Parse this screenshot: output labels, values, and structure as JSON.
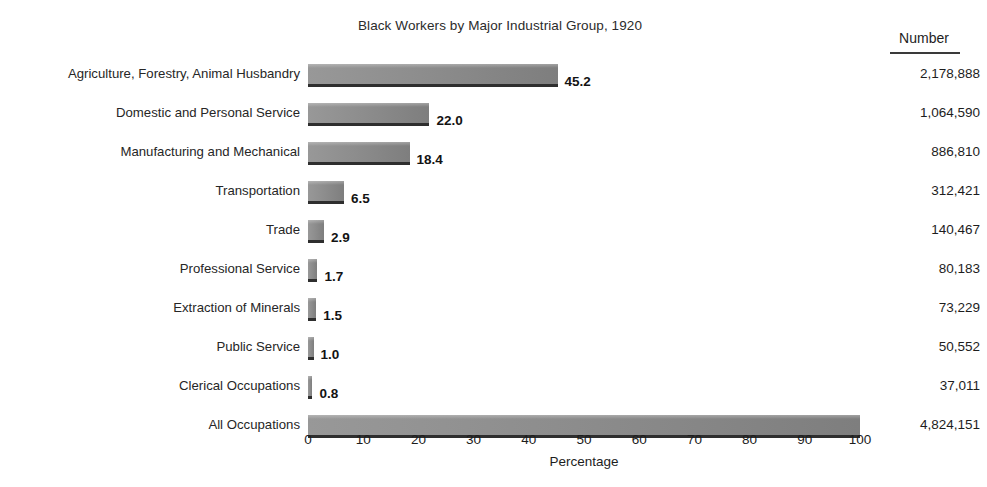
{
  "chart_data": {
    "type": "bar",
    "title": "Black Workers by Major Industrial Group, 1920",
    "orientation": "horizontal",
    "xlabel": "Percentage",
    "ylabel": "",
    "xlim": [
      0,
      100
    ],
    "xticks": [
      0,
      10,
      20,
      30,
      40,
      50,
      60,
      70,
      80,
      90,
      100
    ],
    "grid": false,
    "legend": null,
    "value_column_header": "Number",
    "categories": [
      "Agriculture, Forestry, Animal Husbandry",
      "Domestic and Personal Service",
      "Manufacturing and Mechanical",
      "Transportation",
      "Trade",
      "Professional Service",
      "Extraction of Minerals",
      "Public Service",
      "Clerical Occupations",
      "All Occupations"
    ],
    "values": [
      45.2,
      22.0,
      18.4,
      6.5,
      2.9,
      1.7,
      1.5,
      1.0,
      0.8,
      100.0
    ],
    "value_labels": [
      "45.2",
      "22.0",
      "18.4",
      "6.5",
      "2.9",
      "1.7",
      "1.5",
      "1.0",
      "0.8",
      ""
    ],
    "counts": [
      2178888,
      1064590,
      886810,
      312421,
      140467,
      80183,
      73229,
      50552,
      37011,
      4824151
    ],
    "count_labels": [
      "2,178,888",
      "1,064,590",
      "886,810",
      "312,421",
      "140,467",
      "80,183",
      "73,229",
      "50,552",
      "37,011",
      "4,824,151"
    ],
    "bar_color": "#8d8d8d",
    "bar_edge_color": "#2e2e2e",
    "background_color": "#ffffff",
    "text_color": "#1d1d1d"
  }
}
